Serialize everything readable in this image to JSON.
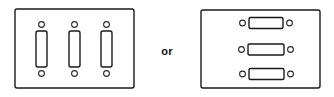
{
  "diagram": {
    "background_color": "#ffffff",
    "line_color": "#1a1a1a",
    "fill_color": "#ffffff",
    "conjunction": {
      "label": "or",
      "x": 167,
      "y": 52
    },
    "options": [
      {
        "name": "vertical-toggle-plate",
        "label": "3-gang vertical toggle switch plate",
        "plate": {
          "x": 15,
          "y": 9,
          "width": 119,
          "height": 79,
          "corner_radius": 2
        },
        "orientation": "vertical",
        "switch_count": 3,
        "switches": [
          {
            "name": "toggle-1",
            "rect": {
              "x": 36,
              "y": 31,
              "width": 11,
              "height": 36,
              "corner_radius": 2
            },
            "holes": [
              {
                "name": "screw-hole-top",
                "cx": 41.5,
                "cy": 24.5,
                "r": 2.9
              },
              {
                "name": "screw-hole-bottom",
                "cx": 41.5,
                "cy": 73.5,
                "r": 2.9
              }
            ]
          },
          {
            "name": "toggle-2",
            "rect": {
              "x": 69,
              "y": 31,
              "width": 11,
              "height": 36,
              "corner_radius": 2
            },
            "holes": [
              {
                "name": "screw-hole-top",
                "cx": 74.5,
                "cy": 24.5,
                "r": 2.9
              },
              {
                "name": "screw-hole-bottom",
                "cx": 74.5,
                "cy": 73.5,
                "r": 2.9
              }
            ]
          },
          {
            "name": "toggle-3",
            "rect": {
              "x": 101,
              "y": 31,
              "width": 11,
              "height": 36,
              "corner_radius": 2
            },
            "holes": [
              {
                "name": "screw-hole-top",
                "cx": 106.5,
                "cy": 24.5,
                "r": 2.9
              },
              {
                "name": "screw-hole-bottom",
                "cx": 106.5,
                "cy": 73.5,
                "r": 2.9
              }
            ]
          }
        ]
      },
      {
        "name": "horizontal-toggle-plate",
        "label": "3-position horizontal toggle switch plate",
        "plate": {
          "x": 201,
          "y": 10,
          "width": 119,
          "height": 78,
          "corner_radius": 2
        },
        "orientation": "horizontal",
        "switch_count": 3,
        "switches": [
          {
            "name": "toggle-1",
            "rect": {
              "x": 249,
              "y": 17.5,
              "width": 34,
              "height": 11,
              "corner_radius": 1.5
            },
            "holes": [
              {
                "name": "screw-hole-left",
                "cx": 242.5,
                "cy": 23,
                "r": 2.9
              },
              {
                "name": "screw-hole-right",
                "cx": 289.5,
                "cy": 23,
                "r": 2.9
              }
            ]
          },
          {
            "name": "toggle-2",
            "rect": {
              "x": 248,
              "y": 44,
              "width": 36,
              "height": 11,
              "corner_radius": 1.5
            },
            "holes": [
              {
                "name": "screw-hole-left",
                "cx": 241.5,
                "cy": 49.5,
                "r": 2.9
              },
              {
                "name": "screw-hole-right",
                "cx": 290.5,
                "cy": 49.5,
                "r": 2.9
              }
            ]
          },
          {
            "name": "toggle-3",
            "rect": {
              "x": 249,
              "y": 68.5,
              "width": 35,
              "height": 11,
              "corner_radius": 1.5
            },
            "holes": [
              {
                "name": "screw-hole-left",
                "cx": 242.5,
                "cy": 74,
                "r": 2.9
              },
              {
                "name": "screw-hole-right",
                "cx": 290.5,
                "cy": 74,
                "r": 2.9
              }
            ]
          }
        ]
      }
    ]
  }
}
